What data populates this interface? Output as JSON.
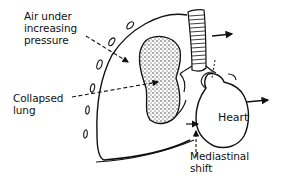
{
  "diagram": {
    "labels": {
      "air": "Air under\nincreasing\npressure",
      "lung": "Collapsed\nlung",
      "heart": "Heart",
      "shift": "Mediastinal\nshift"
    },
    "colors": {
      "ink": "#111111",
      "background": "#ffffff",
      "stipple": "#333333"
    }
  }
}
